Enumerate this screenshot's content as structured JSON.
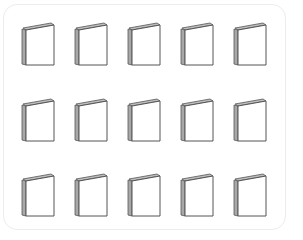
{
  "picture": {
    "description": "Grid of 15 closed books arranged in 3 rows of 5",
    "rows": 3,
    "columns": 5,
    "item_icon": "book-icon",
    "total_items": 15,
    "colors": {
      "outline": "#555555",
      "spine": "#9a9a9a",
      "cover": "#ffffff",
      "frame_border": "#ececec"
    },
    "items": [
      {
        "row": 1,
        "col": 1
      },
      {
        "row": 1,
        "col": 2
      },
      {
        "row": 1,
        "col": 3
      },
      {
        "row": 1,
        "col": 4
      },
      {
        "row": 1,
        "col": 5
      },
      {
        "row": 2,
        "col": 1
      },
      {
        "row": 2,
        "col": 2
      },
      {
        "row": 2,
        "col": 3
      },
      {
        "row": 2,
        "col": 4
      },
      {
        "row": 2,
        "col": 5
      },
      {
        "row": 3,
        "col": 1
      },
      {
        "row": 3,
        "col": 2
      },
      {
        "row": 3,
        "col": 3
      },
      {
        "row": 3,
        "col": 4
      },
      {
        "row": 3,
        "col": 5
      }
    ]
  }
}
